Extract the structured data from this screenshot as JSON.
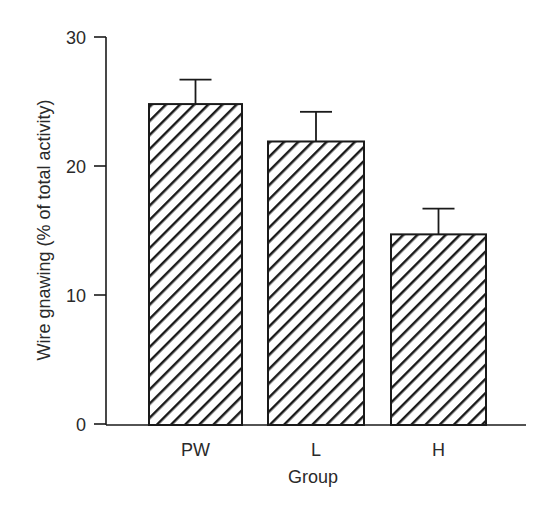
{
  "chart_data": {
    "type": "bar",
    "title": "",
    "xlabel": "Group",
    "ylabel": "Wire gnawing (% of total activity)",
    "categories": [
      "PW",
      "L",
      "H"
    ],
    "values": [
      24.8,
      21.9,
      14.7
    ],
    "error_upper": [
      1.9,
      2.3,
      2.0
    ],
    "ylim": [
      0,
      30
    ],
    "yticks": [
      0,
      10,
      20,
      30
    ],
    "grid": false,
    "legend": null,
    "bar_fill": "diagonal-hatch",
    "colors": {
      "stroke": "#1a1a1a",
      "fill": "#ffffff",
      "text": "#2a2a2a"
    }
  }
}
